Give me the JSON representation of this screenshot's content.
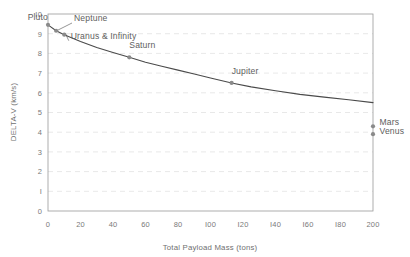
{
  "chart_data": {
    "type": "line",
    "title": "",
    "xlabel": "Total Payload Mass (tons)",
    "ylabel": "DELTA-V (km/s)",
    "xlim": [
      0,
      200
    ],
    "ylim": [
      0,
      10
    ],
    "grid": "horizontal-dashed",
    "legend": "none",
    "x_ticks": [
      0,
      20,
      40,
      60,
      80,
      100,
      120,
      140,
      160,
      180,
      200
    ],
    "x_tick_labels": [
      "0",
      "20",
      "40",
      "60",
      "80",
      "I00",
      "I20",
      "I40",
      "I60",
      "I80",
      "200"
    ],
    "y_ticks": [
      0,
      1,
      2,
      3,
      4,
      5,
      6,
      7,
      8,
      9,
      10
    ],
    "y_tick_labels": [
      "0",
      "I",
      "2",
      "3",
      "4",
      "5",
      "6",
      "7",
      "8",
      "9",
      "I0"
    ],
    "series": [
      {
        "name": "delta-v curve",
        "color": "#4a4a4a",
        "x": [
          0,
          5,
          10,
          20,
          30,
          40,
          50,
          60,
          70,
          80,
          90,
          100,
          113,
          125,
          140,
          155,
          170,
          185,
          200
        ],
        "y": [
          9.45,
          9.15,
          8.95,
          8.6,
          8.3,
          8.05,
          7.8,
          7.55,
          7.35,
          7.15,
          6.95,
          6.75,
          6.5,
          6.3,
          6.1,
          5.92,
          5.78,
          5.65,
          5.5
        ]
      }
    ],
    "annotated_points": [
      {
        "label": "Pluto",
        "x": 0,
        "y": 9.45,
        "label_x": 0,
        "label_y": 9.72,
        "anchor": "end",
        "leader": false
      },
      {
        "label": "Neptune",
        "x": 5,
        "y": 9.15,
        "label_x": 16,
        "label_y": 9.62,
        "anchor": "start",
        "leader": true
      },
      {
        "label": "Uranus & Infinity",
        "x": 10,
        "y": 8.95,
        "label_x": 14,
        "label_y": 8.72,
        "anchor": "start",
        "leader": true
      },
      {
        "label": "Saturn",
        "x": 50,
        "y": 7.8,
        "label_x": 50,
        "label_y": 8.25,
        "anchor": "start",
        "leader": false
      },
      {
        "label": "Jupiter",
        "x": 113,
        "y": 6.5,
        "label_x": 113,
        "label_y": 6.95,
        "anchor": "start",
        "leader": false
      },
      {
        "label": "Mars",
        "x": 200,
        "y": 4.3,
        "label_x": 204,
        "label_y": 4.35,
        "anchor": "start",
        "leader": false
      },
      {
        "label": "Venus",
        "x": 200,
        "y": 3.9,
        "label_x": 204,
        "label_y": 3.92,
        "anchor": "start",
        "leader": false
      }
    ],
    "colors": {
      "line": "#4a4a4a",
      "point": "#8a8a8a",
      "grid": "#d8d8d8",
      "frame": "#9a9a9a",
      "text": "#6b6b6b",
      "background": "#ffffff"
    }
  },
  "axes": {
    "y_title": "DELTA-V (km/s)",
    "x_title": "Total Payload Mass (tons)"
  },
  "labels": {
    "pluto": "Pluto",
    "neptune": "Neptune",
    "uranus_infinity": "Uranus & Infinity",
    "saturn": "Saturn",
    "jupiter": "Jupiter",
    "mars": "Mars",
    "venus": "Venus"
  },
  "y_tick_0": "0",
  "y_tick_1": "I",
  "y_tick_2": "2",
  "y_tick_3": "3",
  "y_tick_4": "4",
  "y_tick_5": "5",
  "y_tick_6": "6",
  "y_tick_7": "7",
  "y_tick_8": "8",
  "y_tick_9": "9",
  "y_tick_10": "I0",
  "x_tick_0": "0",
  "x_tick_20": "20",
  "x_tick_40": "40",
  "x_tick_60": "60",
  "x_tick_80": "80",
  "x_tick_100": "I00",
  "x_tick_120": "I20",
  "x_tick_140": "I40",
  "x_tick_160": "I60",
  "x_tick_180": "I80",
  "x_tick_200": "200"
}
